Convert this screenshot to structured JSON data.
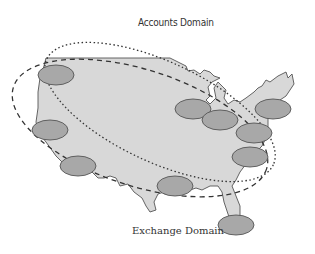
{
  "diagram": {
    "type": "network-domain-map",
    "map": "United States outline",
    "domains": [
      {
        "name": "Accounts Domain",
        "label": "Accounts Domain",
        "line_style": "dotted"
      },
      {
        "name": "Exchange Domain",
        "label": "Exchange Domain",
        "line_style": "dashed"
      }
    ],
    "sites": [
      {
        "id": "northwest",
        "cx": 56,
        "cy": 75
      },
      {
        "id": "west-coast-middle",
        "cx": 50,
        "cy": 130
      },
      {
        "id": "southwest",
        "cx": 78,
        "cy": 166
      },
      {
        "id": "midwest-west",
        "cx": 193,
        "cy": 109
      },
      {
        "id": "midwest-east",
        "cx": 220,
        "cy": 120
      },
      {
        "id": "northeast",
        "cx": 273,
        "cy": 109
      },
      {
        "id": "mid-atlantic",
        "cx": 254,
        "cy": 133
      },
      {
        "id": "southeast",
        "cx": 250,
        "cy": 157
      },
      {
        "id": "gulf-south",
        "cx": 175,
        "cy": 186
      },
      {
        "id": "florida",
        "cx": 236,
        "cy": 225
      }
    ],
    "colors": {
      "land": "#d8d8d8",
      "site_fill": "#a8a8a8",
      "outline": "#555555",
      "text": "#333333"
    }
  }
}
